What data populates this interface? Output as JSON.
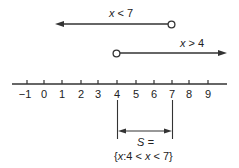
{
  "diagram": {
    "type": "number-line-intersection",
    "ray_left": {
      "label_var": "x",
      "label_rest": " < 7",
      "endpoint": 7,
      "endpoint_style": "open",
      "direction": "left"
    },
    "ray_right": {
      "label_var": "x",
      "label_rest": " > 4",
      "endpoint": 4,
      "endpoint_style": "open",
      "direction": "right"
    },
    "axis": {
      "ticks": [
        "−1",
        "0",
        "1",
        "2",
        "3",
        "4",
        "5",
        "6",
        "7",
        "8",
        "9"
      ]
    },
    "solution": {
      "line1": "S =",
      "line2_open": "{",
      "line2_var1": "x",
      "line2_mid": ":4 < ",
      "line2_var2": "x",
      "line2_end": " < 7}",
      "from": 4,
      "to": 7
    }
  }
}
